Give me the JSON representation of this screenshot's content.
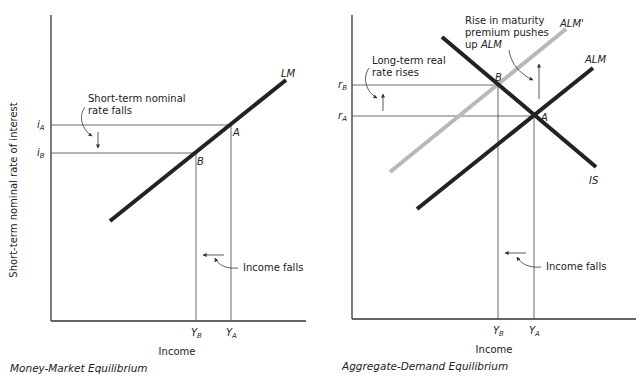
{
  "colors": {
    "curve": "#222222",
    "shifted_curve": "#b8b8b8",
    "axis": "#333333",
    "text": "#222222",
    "background": "#ffffff"
  },
  "left_panel": {
    "caption": "Money-Market Equilibrium",
    "y_axis_label": "Short-term nominal rate of interest",
    "x_axis_label": "Income",
    "y_ticks": [
      {
        "base": "i",
        "sub": "A"
      },
      {
        "base": "i",
        "sub": "B"
      }
    ],
    "x_ticks": [
      {
        "base": "Y",
        "sub": "B"
      },
      {
        "base": "Y",
        "sub": "A"
      }
    ],
    "curves": [
      {
        "label": "LM"
      }
    ],
    "points": [
      {
        "label": "A"
      },
      {
        "label": "B"
      }
    ],
    "annotations": {
      "rate": {
        "line1": "Short-term nominal",
        "line2": "rate falls"
      },
      "income": "Income falls"
    }
  },
  "right_panel": {
    "caption": "Aggregate-Demand Equilibrium",
    "x_axis_label": "Income",
    "y_ticks": [
      {
        "base": "r",
        "sub": "B"
      },
      {
        "base": "r",
        "sub": "A"
      }
    ],
    "x_ticks": [
      {
        "base": "Y",
        "sub": "B"
      },
      {
        "base": "Y",
        "sub": "A"
      }
    ],
    "curves": [
      {
        "label": "ALM'"
      },
      {
        "label": "ALM"
      },
      {
        "label": "IS"
      }
    ],
    "points": [
      {
        "label": "A"
      },
      {
        "label": "B"
      }
    ],
    "annotations": {
      "rate": {
        "line1": "Long-term real",
        "line2": "rate rises"
      },
      "shift": {
        "line1": "Rise in maturity",
        "line2": "premium pushes",
        "line3_prefix": "up ",
        "line3_em": "ALM"
      },
      "income": "Income falls"
    }
  }
}
